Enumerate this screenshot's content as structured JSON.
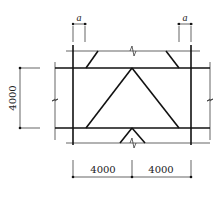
{
  "diagram": {
    "type": "structural bracing elevation (inverted-V / chevron braces between beams)",
    "labels": {
      "top_left_offset": "a",
      "top_right_offset": "a",
      "height_dimension": "4000",
      "bottom_left_span": "4000",
      "bottom_right_span": "4000"
    },
    "elements": {
      "columns": 2,
      "beams": 2,
      "braces": [
        "top-left knee",
        "top-right knee",
        "central chevron left",
        "central chevron right",
        "bottom chevron stub"
      ],
      "break_marks": [
        "top center",
        "bottom center",
        "left",
        "right"
      ]
    },
    "colors": {
      "line": "#111111",
      "background": "#ffffff"
    }
  }
}
